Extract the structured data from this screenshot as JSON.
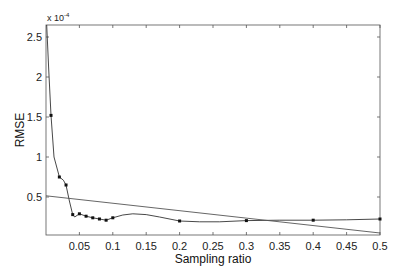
{
  "chart_data": {
    "type": "line",
    "title": "",
    "xlabel": "Sampling ratio",
    "ylabel": "RMSE",
    "y_exponent_label": "x 10",
    "y_exponent": "-4",
    "xlim": [
      0,
      0.5
    ],
    "ylim": [
      0.025,
      2.65
    ],
    "grid": false,
    "legend": null,
    "x_ticks": [
      0.05,
      0.1,
      0.15,
      0.2,
      0.25,
      0.3,
      0.35,
      0.4,
      0.45,
      0.5
    ],
    "x_tick_labels": [
      "0.05",
      "0.1",
      "0.15",
      "0.2",
      "0.25",
      "0.3",
      "0.35",
      "0.4",
      "0.45",
      "0.5"
    ],
    "y_ticks": [
      0.5,
      1,
      1.5,
      2,
      2.5
    ],
    "y_tick_labels": [
      "0.5",
      "1",
      "1.5",
      "2",
      "2.5"
    ],
    "series": [
      {
        "name": "RMSE (interpolated curve with markers)",
        "marker": "dot",
        "x": [
          0.0075,
          0.02,
          0.03,
          0.04,
          0.05,
          0.06,
          0.07,
          0.08,
          0.09,
          0.1,
          0.2,
          0.3,
          0.4,
          0.5
        ],
        "values": [
          1.52,
          0.75,
          0.65,
          0.28,
          0.29,
          0.26,
          0.24,
          0.225,
          0.21,
          0.24,
          0.2,
          0.205,
          0.21,
          0.225
        ],
        "curve_x": [
          0.001,
          0.004,
          0.0075,
          0.012,
          0.02,
          0.026,
          0.03,
          0.035,
          0.04,
          0.043,
          0.05,
          0.06,
          0.07,
          0.08,
          0.09,
          0.1,
          0.115,
          0.13,
          0.15,
          0.17,
          0.2,
          0.23,
          0.26,
          0.3,
          0.35,
          0.4,
          0.45,
          0.5
        ],
        "curve_y": [
          2.65,
          2.1,
          1.52,
          1.0,
          0.75,
          0.71,
          0.65,
          0.45,
          0.28,
          0.25,
          0.29,
          0.26,
          0.24,
          0.225,
          0.21,
          0.24,
          0.275,
          0.29,
          0.28,
          0.25,
          0.2,
          0.19,
          0.19,
          0.205,
          0.21,
          0.21,
          0.215,
          0.225
        ]
      },
      {
        "name": "Reference line",
        "marker": "none",
        "x": [
          0,
          0.5
        ],
        "values": [
          0.515,
          0.05
        ]
      }
    ]
  }
}
